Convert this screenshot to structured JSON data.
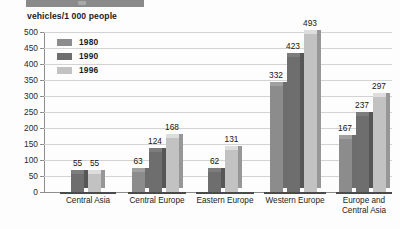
{
  "header": {
    "strip_label": ""
  },
  "chart_data": {
    "type": "bar",
    "title": "vehicles/1 000 people",
    "xlabel": "",
    "ylabel": "",
    "ylim": [
      0,
      500
    ],
    "yticks": [
      0,
      50,
      100,
      150,
      200,
      250,
      300,
      350,
      400,
      450,
      500
    ],
    "grid": true,
    "legend_position": "top-left",
    "categories": [
      "Central Asia",
      "Central Europe",
      "Eastern Europe",
      "Western Europe",
      "Europe and Central Asia"
    ],
    "series": [
      {
        "name": "1980",
        "color": "#8c8c8c",
        "values": [
          null,
          63,
          null,
          332,
          167
        ]
      },
      {
        "name": "1990",
        "color": "#6e6e6e",
        "values": [
          55,
          124,
          62,
          423,
          237
        ]
      },
      {
        "name": "1996",
        "color": "#c2c2c2",
        "values": [
          55,
          168,
          131,
          493,
          297
        ]
      }
    ]
  },
  "colors": {
    "series_1980": "#8c8c8c",
    "series_1990": "#6e6e6e",
    "series_1996": "#c2c2c2",
    "grid": "#d3d3d3",
    "axis": "#8e8e8e",
    "text": "#1c1c1c",
    "header_strip": "#8a8a8a"
  }
}
